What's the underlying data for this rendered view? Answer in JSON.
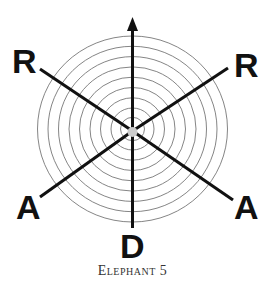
{
  "diagram": {
    "labels": {
      "top_left": "R",
      "top_right": "R",
      "bottom_left": "A",
      "bottom_right": "A",
      "bottom": "D"
    },
    "rings": 9,
    "center_dot_color": "#cccccc",
    "line_color": "#111111",
    "ring_color": "#777777"
  },
  "caption": "Elephant 5"
}
